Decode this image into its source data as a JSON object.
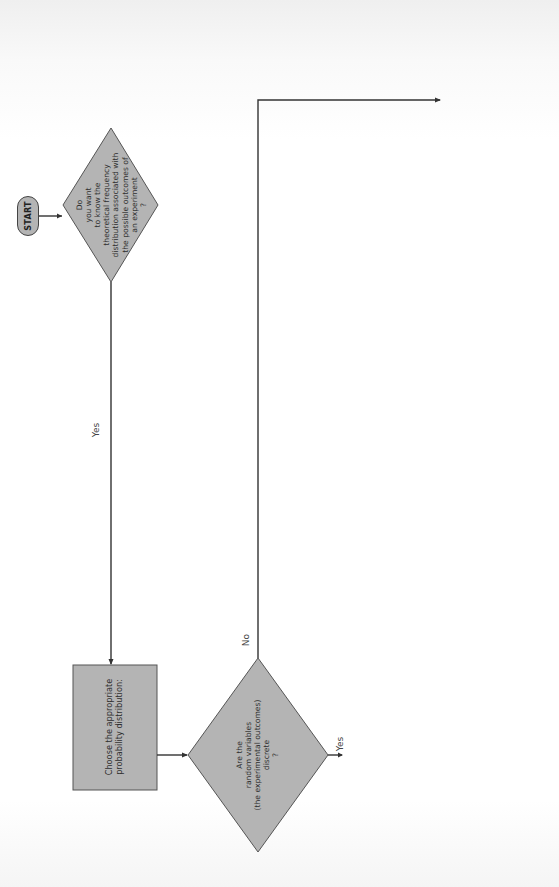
{
  "orientation": "rotated-90-ccw",
  "nodes": {
    "start": {
      "label": "START"
    },
    "want_distribution": {
      "text": "Do\nyou want\nto know the\ntheoretical frequency\ndistribution associated with\nthe possible outcomes of\nan experiment\n?"
    },
    "choose_distribution": {
      "text": "Choose the appropriate\nprobability distribution:"
    },
    "discrete_question": {
      "text": "Are the\nrandom variables\n(the experimental outcomes)\ndiscrete\n?"
    },
    "binomial_question": {
      "text": "①\nDoes each\ntrial have only\ntwo possible outcomes?\n② Does the probability of the\noutcome of any trial remain fixed\nover time? ③ Are the trials\nstatistically independent\n?",
      "page_ref": "p. 214"
    },
    "poisson_question": {
      "text": "①\nCan the\nmean arrival time\nbe estimated from past\ndata? ② Is the probability that\nexactly 1 arrival will occur in one\ninterval a very small number and constant?\n③ Is the probability that 2 or more arrivals will\noccur in one interval such a small number that we can assign\nit a zero value? ④ Is the number of arrivals per\ninterval independent of time? ⑤ Is the\nnumber of arrivals per interval not\ndependent on the number of\narrivals in any other\ninterval\n?",
      "page_ref": "p. 224"
    },
    "consult_statistician": {
      "text": "Consult a statistician\nabout other possible\ndistributions"
    },
    "normal_question": {
      "text": "①\nDoes the curve\nhave a single peak? ②\nDoes the mean lie at the center of the\ncurve? ③ Is the curve symmetrical? ④ Do\nthe two tails of the curve extend\ninfinitely and never touch\nthe horizontal axis\n?"
    }
  },
  "edge_labels": {
    "want_yes": "Yes",
    "discrete_no": "No",
    "discrete_yes": "Yes",
    "binomial_no": "No",
    "binomial_yes": "Yes",
    "poisson_no": "No",
    "poisson_yes": "Yes",
    "normal_no": "No",
    "normal_yes": "Yes"
  },
  "colors": {
    "shape_fill": "#b4b4b4",
    "shape_stroke": "#555555",
    "line": "#333333",
    "background": "#ffffff"
  }
}
